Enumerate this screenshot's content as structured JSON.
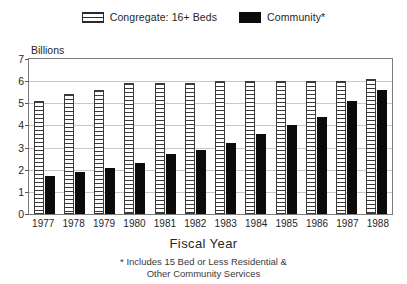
{
  "chart_data": {
    "type": "bar",
    "title": "",
    "xlabel": "Fiscal Year",
    "ylabel": "Billions",
    "ylim": [
      0,
      7
    ],
    "yticks": [
      0,
      1,
      2,
      3,
      4,
      5,
      6,
      7
    ],
    "grid": true,
    "legend_position": "top-center",
    "categories": [
      "1977",
      "1978",
      "1979",
      "1980",
      "1981",
      "1982",
      "1983",
      "1984",
      "1985",
      "1986",
      "1987",
      "1988"
    ],
    "series": [
      {
        "name": "Congregate: 16+ Beds",
        "style": "horizontal-hatch",
        "color": "#3a3a3a",
        "values": [
          5.1,
          5.4,
          5.6,
          5.9,
          5.9,
          5.9,
          6.0,
          6.0,
          6.0,
          6.0,
          6.0,
          6.1
        ]
      },
      {
        "name": "Community*",
        "style": "solid",
        "color": "#0b0b0b",
        "values": [
          1.7,
          1.9,
          2.1,
          2.3,
          2.7,
          2.9,
          3.2,
          3.6,
          4.0,
          4.4,
          5.1,
          5.6
        ]
      }
    ],
    "annotations": [
      "* Includes 15 Bed or Less Residential & Other Community Services"
    ]
  },
  "legend": {
    "entries": [
      {
        "label": "Congregate: 16+ Beds",
        "swatch": "hatched-swatch-icon"
      },
      {
        "label": "Community*",
        "swatch": "solid-swatch-icon"
      }
    ]
  },
  "axes": {
    "y_unit_label": "Billions",
    "x_title": "Fiscal Year"
  },
  "footnote": {
    "line1": "* Includes 15 Bed or Less Residential &",
    "line2": "Other Community Services"
  }
}
